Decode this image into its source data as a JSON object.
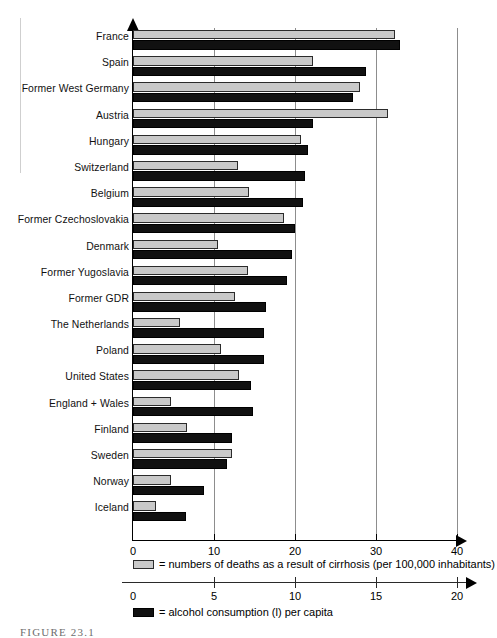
{
  "figure": {
    "caption": "FIGURE   23.1"
  },
  "chart_data": {
    "type": "bar",
    "orientation": "horizontal",
    "title": "",
    "grid": true,
    "legend_position": "bottom",
    "categories": [
      "France",
      "Spain",
      "Former West Germany",
      "Austria",
      "Hungary",
      "Switzerland",
      "Belgium",
      "Former Czechoslovakia",
      "Denmark",
      "Former Yugoslavia",
      "Former GDR",
      "The Netherlands",
      "Poland",
      "United States",
      "England + Wales",
      "Finland",
      "Sweden",
      "Norway",
      "Iceland"
    ],
    "series": [
      {
        "name": "= numbers of deaths as a result of cirrhosis (per 100,000 inhabitants)",
        "short_name": "deaths",
        "color": "#c9c9c9",
        "axis": "top",
        "xlim": [
          0,
          40
        ],
        "ticks": [
          0,
          10,
          20,
          30,
          40
        ],
        "values": [
          32.3,
          22.2,
          28.0,
          31.5,
          20.7,
          13.0,
          14.3,
          18.6,
          10.5,
          14.2,
          12.6,
          5.8,
          10.9,
          13.1,
          4.7,
          6.7,
          12.2,
          4.7,
          2.9
        ]
      },
      {
        "name": "= alcohol consumption (l) per capita",
        "short_name": "alcohol",
        "color": "#111111",
        "axis": "bottom",
        "xlim": [
          0,
          20
        ],
        "ticks": [
          0,
          5,
          10,
          15,
          20
        ],
        "values": [
          16.5,
          14.4,
          13.6,
          11.1,
          10.8,
          10.6,
          10.5,
          10.0,
          9.8,
          9.5,
          8.2,
          8.1,
          8.1,
          7.3,
          7.4,
          6.1,
          5.8,
          4.4,
          3.3
        ]
      }
    ],
    "axis_deaths": {
      "label": "",
      "tick_labels": [
        "0",
        "10",
        "20",
        "30",
        "40"
      ]
    },
    "axis_alcohol": {
      "label": "",
      "tick_labels": [
        "0",
        "5",
        "10",
        "15",
        "20"
      ]
    }
  }
}
